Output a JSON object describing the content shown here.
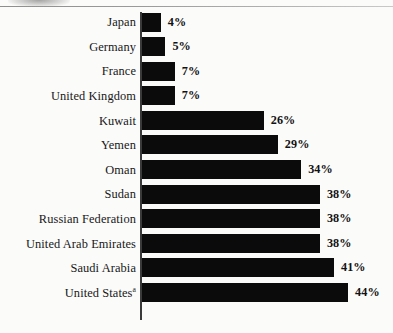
{
  "page": {
    "background_color": "#fbfbfa",
    "artifacts": {
      "top_rule": "horizontal-rule",
      "smudge": "scan-smudge-arc"
    }
  },
  "chart_data": {
    "type": "bar",
    "orientation": "horizontal",
    "title": "",
    "subtitle": "",
    "xlabel": "",
    "ylabel": "",
    "xlim": [
      0,
      44
    ],
    "grid": false,
    "legend": null,
    "bar_color": "#0b0b0b",
    "value_suffix": "%",
    "categories": [
      "Japan",
      "Germany",
      "France",
      "United Kingdom",
      "Kuwait",
      "Yemen",
      "Oman",
      "Sudan",
      "Russian Federation",
      "United Arab Emirates",
      "Saudi Arabia",
      "United States"
    ],
    "values": [
      4,
      5,
      7,
      7,
      26,
      29,
      34,
      38,
      38,
      38,
      41,
      44
    ],
    "value_labels": [
      "4%",
      "5%",
      "7%",
      "7%",
      "26%",
      "29%",
      "34%",
      "38%",
      "38%",
      "38%",
      "41%",
      "44%"
    ],
    "footnote_markers": {
      "United States": "a"
    }
  },
  "rows": [
    {
      "label": "Japan",
      "marker": "",
      "value": 4,
      "value_label": "4%"
    },
    {
      "label": "Germany",
      "marker": "",
      "value": 5,
      "value_label": "5%"
    },
    {
      "label": "France",
      "marker": "",
      "value": 7,
      "value_label": "7%"
    },
    {
      "label": "United Kingdom",
      "marker": "",
      "value": 7,
      "value_label": "7%"
    },
    {
      "label": "Kuwait",
      "marker": "",
      "value": 26,
      "value_label": "26%"
    },
    {
      "label": "Yemen",
      "marker": "",
      "value": 29,
      "value_label": "29%"
    },
    {
      "label": "Oman",
      "marker": "",
      "value": 34,
      "value_label": "34%"
    },
    {
      "label": "Sudan",
      "marker": "",
      "value": 38,
      "value_label": "38%"
    },
    {
      "label": "Russian Federation",
      "marker": "",
      "value": 38,
      "value_label": "38%"
    },
    {
      "label": "United Arab Emirates",
      "marker": "",
      "value": 38,
      "value_label": "38%"
    },
    {
      "label": "Saudi Arabia",
      "marker": "",
      "value": 41,
      "value_label": "41%"
    },
    {
      "label": "United States",
      "marker": "a",
      "value": 44,
      "value_label": "44%"
    }
  ]
}
